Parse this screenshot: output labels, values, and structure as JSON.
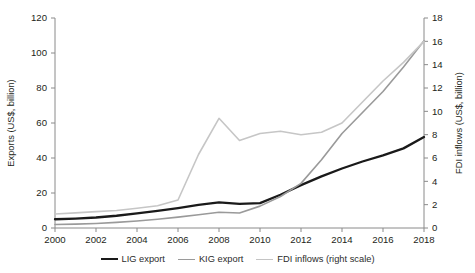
{
  "top_caption": "",
  "legend": {
    "position": "bottom-center",
    "items": [
      {
        "label": "LIG export",
        "color": "#1a1a1a",
        "key": "lig"
      },
      {
        "label": "KIG export",
        "color": "#9a9a9a",
        "key": "kig"
      },
      {
        "label": "FDI inflows (right scale)",
        "color": "#c6c6c6",
        "key": "fdi"
      }
    ]
  },
  "chart_data": {
    "type": "line",
    "title": "",
    "xlabel": "",
    "ylabel": "Exports (US$, billion)",
    "y2label": "FDI inflows (US$, billion)",
    "grid": false,
    "xlim": [
      2000,
      2018
    ],
    "ylim": [
      0,
      120
    ],
    "y2lim": [
      0,
      18
    ],
    "xticks": [
      2000,
      2002,
      2004,
      2006,
      2008,
      2010,
      2012,
      2014,
      2016,
      2018
    ],
    "xticklabels": [
      "2000",
      "2002",
      "2004",
      "2006",
      "2008",
      "2010",
      "2012",
      "2014",
      "2016",
      "2018"
    ],
    "yticks": [
      0,
      20,
      40,
      60,
      80,
      100,
      120
    ],
    "yticklabels": [
      "0",
      "20",
      "40",
      "60",
      "80",
      "100",
      "120"
    ],
    "y2ticks": [
      0,
      2,
      4,
      6,
      8,
      10,
      12,
      14,
      16,
      18
    ],
    "y2ticklabels": [
      "0",
      "2",
      "4",
      "6",
      "8",
      "10",
      "12",
      "14",
      "16",
      "18"
    ],
    "x": [
      2000,
      2001,
      2002,
      2003,
      2004,
      2005,
      2006,
      2007,
      2008,
      2009,
      2010,
      2011,
      2012,
      2013,
      2014,
      2015,
      2016,
      2017,
      2018
    ],
    "series": [
      {
        "name": "LIG export",
        "axis": "left",
        "color": "#1a1a1a",
        "values": [
          5.0,
          5.4,
          6.0,
          7.0,
          8.3,
          9.8,
          11.4,
          13.2,
          14.6,
          13.8,
          14.2,
          19.0,
          24.5,
          29.5,
          34.0,
          38.0,
          41.5,
          45.5,
          52.0
        ]
      },
      {
        "name": "KIG export",
        "axis": "left",
        "color": "#9a9a9a",
        "values": [
          2.0,
          2.2,
          2.6,
          3.2,
          4.0,
          5.0,
          6.2,
          7.6,
          9.0,
          8.6,
          12.5,
          18.0,
          25.5,
          39.0,
          54.0,
          66.0,
          78.0,
          92.0,
          107.0
        ]
      },
      {
        "name": "FDI inflows (right scale)",
        "axis": "right",
        "color": "#c6c6c6",
        "values": [
          1.2,
          1.3,
          1.4,
          1.5,
          1.7,
          1.9,
          2.4,
          6.3,
          9.4,
          7.5,
          8.1,
          8.3,
          8.0,
          8.2,
          9.0,
          10.8,
          12.6,
          14.2,
          16.0
        ]
      }
    ]
  }
}
